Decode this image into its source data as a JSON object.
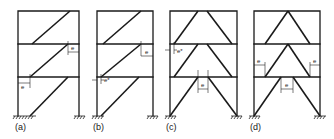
{
  "figure": {
    "panels": [
      {
        "id": "a",
        "label": "(a)",
        "type": "single-diagonal eccentric brace"
      },
      {
        "id": "b",
        "label": "(b)",
        "type": "single-diagonal eccentric brace with e*"
      },
      {
        "id": "c",
        "label": "(c)",
        "type": "inverted-V / V eccentric brace with e*"
      },
      {
        "id": "d",
        "label": "(d)",
        "type": "inverted-V / V eccentric brace"
      }
    ],
    "annotations": {
      "e": "e",
      "e_star": "e*"
    },
    "colors": {
      "line": "#1a1a1a",
      "background": "#ffffff"
    }
  }
}
